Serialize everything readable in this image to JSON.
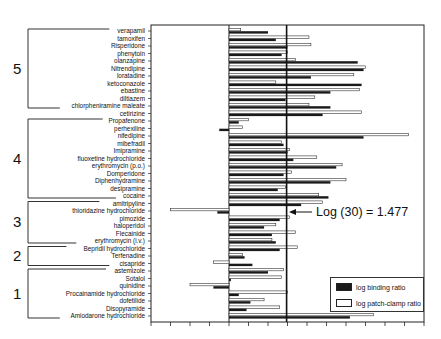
{
  "chart_data": {
    "type": "bar",
    "orientation": "horizontal",
    "title": "",
    "xlabel": "",
    "ylabel": "",
    "xlim": [
      -2,
      5
    ],
    "x_tick_step": 0.5,
    "x_tick_labels_visible": false,
    "grid": false,
    "legend_position": "lower right",
    "reference_line": {
      "value": 1.477,
      "label": "Log (30) = 1.477"
    },
    "categories": [
      "verapamil",
      "tamoxifen",
      "Risperidone",
      "phenytoin",
      "olanzapine",
      "Nitrendipine",
      "loratadine",
      "ketoconazole",
      "ebastine",
      "diltiazem",
      "chlorpheniramine maleate",
      "cetirizine",
      "Propafenone",
      "perhexiline",
      "nifedipine",
      "mibefradil",
      "Imipramine",
      "fluoxetine hydrochloride",
      "erythromycin (p.o.)",
      "Domperidone",
      "Diphenhydramine",
      "desipramine",
      "cocaine",
      "amitripyline",
      "thioridazine hydrochloride",
      "pimozide",
      "haloperidol",
      "Flecainide",
      "erythromycin (i.v.)",
      "Bepridil hydrochloride",
      "Terfenadine",
      "cisapride",
      "astemizole",
      "Sotalol",
      "quinidine",
      "Procainamide hydrochloride",
      "dofetilide",
      "Disopyramide",
      "Amiodarone hydrochloride"
    ],
    "groups": [
      {
        "label": "5",
        "first": "verapamil",
        "last": "chlorpheniramine maleate"
      },
      {
        "label": "4",
        "first": "Propafenone",
        "last": "cocaine"
      },
      {
        "label": "3",
        "first": "amitripyline",
        "last": "erythromycin (i.v.)"
      },
      {
        "label": "2",
        "first": "Bepridil hydrochloride",
        "last": "cisapride"
      },
      {
        "label": "1",
        "first": "astemizole",
        "last": "Amiodarone hydrochloride"
      }
    ],
    "series": [
      {
        "name": "log patch-clamp ratio",
        "color": "#ffffff",
        "values": [
          0.3,
          2.05,
          2.1,
          1.5,
          1.7,
          3.5,
          3.2,
          1.2,
          3.35,
          2.2,
          2.05,
          3.4,
          0.5,
          0.35,
          4.6,
          1.35,
          1.55,
          2.25,
          2.9,
          1.6,
          3.0,
          1.45,
          2.3,
          2.4,
          -1.5,
          1.55,
          1.2,
          1.7,
          1.1,
          1.75,
          0.35,
          -0.4,
          1.4,
          1.35,
          -1.0,
          1.5,
          0.9,
          1.3,
          3.7
        ]
      },
      {
        "name": "log binding ratio",
        "color": "#1a1a1a",
        "values": [
          1.0,
          1.2,
          1.5,
          1.35,
          3.3,
          3.45,
          2.1,
          3.4,
          2.6,
          1.45,
          2.6,
          2.4,
          0.25,
          -0.25,
          3.45,
          1.4,
          1.5,
          1.65,
          2.75,
          1.4,
          2.6,
          1.25,
          2.55,
          1.85,
          -0.3,
          1.3,
          0.9,
          1.1,
          1.2,
          1.3,
          0.4,
          0.6,
          1.0,
          0.05,
          -0.4,
          0.25,
          0.55,
          0.45,
          3.1
        ]
      }
    ]
  },
  "legend": {
    "items": [
      {
        "label": "log binding ratio",
        "swatch": "#1a1a1a"
      },
      {
        "label": "log patch-clamp ratio",
        "swatch": "#ffffff"
      }
    ]
  },
  "annotation": {
    "text": "Log (30) = 1.477"
  }
}
